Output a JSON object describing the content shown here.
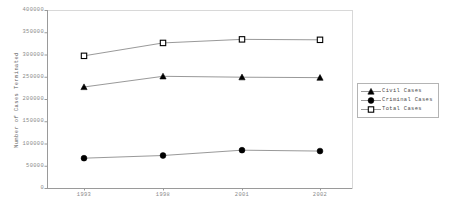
{
  "chart_data": {
    "type": "line",
    "title": "",
    "xlabel": "",
    "ylabel": "Number of Cases Terminated",
    "categories": [
      "1993",
      "1998",
      "2001",
      "2002"
    ],
    "ylim": [
      0,
      400000
    ],
    "yticks": [
      "0",
      "50000",
      "100000",
      "150000",
      "200000",
      "250000",
      "300000",
      "350000",
      "400000"
    ],
    "ytick_values": [
      0,
      50000,
      100000,
      150000,
      200000,
      250000,
      300000,
      350000,
      400000
    ],
    "grid": false,
    "legend_position": "right",
    "series": [
      {
        "name": "Civil Cases",
        "marker": "triangle-filled",
        "color": "#000000",
        "values": [
          227000,
          251000,
          249000,
          248000
        ]
      },
      {
        "name": "Criminal Cases",
        "marker": "circle-filled",
        "color": "#000000",
        "values": [
          67000,
          73000,
          85000,
          83000
        ]
      },
      {
        "name": "Total Cases",
        "marker": "square-open",
        "color": "#000000",
        "values": [
          297000,
          326000,
          334000,
          333000
        ]
      }
    ]
  },
  "legend": {
    "items": [
      {
        "label": "Civil Cases",
        "marker": "triangle-filled"
      },
      {
        "label": "Criminal Cases",
        "marker": "circle-filled"
      },
      {
        "label": "Total Cases",
        "marker": "square-open"
      }
    ]
  },
  "colors": {
    "axis": "#9a9a9a",
    "line": "#8d8d8d",
    "marker": "#000000",
    "tick_text": "#8a8a8a",
    "label_text": "#5a5a5a",
    "legend_border": "#b4b4b4",
    "background": "#ffffff"
  }
}
